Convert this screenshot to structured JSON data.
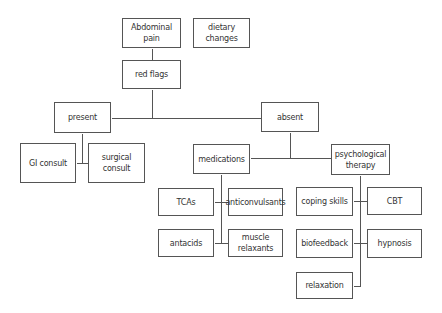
{
  "diagram": {
    "type": "flowchart",
    "background": "#ffffff",
    "line_color": "#555555",
    "nodes": [
      {
        "id": "abdominal-pain",
        "label": "Abdominal pain",
        "x": 122,
        "y": 18,
        "w": 59,
        "h": 30
      },
      {
        "id": "dietary-changes",
        "label": "dietary changes",
        "x": 193,
        "y": 18,
        "w": 57,
        "h": 30
      },
      {
        "id": "red-flags",
        "label": "red flags",
        "x": 122,
        "y": 60,
        "w": 59,
        "h": 29
      },
      {
        "id": "present",
        "label": "present",
        "x": 54,
        "y": 102,
        "w": 57,
        "h": 31
      },
      {
        "id": "absent",
        "label": "absent",
        "x": 261,
        "y": 102,
        "w": 58,
        "h": 30
      },
      {
        "id": "gi-consult",
        "label": "GI consult",
        "x": 20,
        "y": 143,
        "w": 56,
        "h": 40
      },
      {
        "id": "surgical-consult",
        "label": "surgical consult",
        "x": 88,
        "y": 143,
        "w": 57,
        "h": 40
      },
      {
        "id": "medications",
        "label": "medications",
        "x": 193,
        "y": 144,
        "w": 57,
        "h": 30
      },
      {
        "id": "psychological-therapy",
        "label": "psychological\ntherapy",
        "x": 331,
        "y": 144,
        "w": 59,
        "h": 31
      },
      {
        "id": "tcas",
        "label": "TCAs",
        "x": 158,
        "y": 188,
        "w": 56,
        "h": 28
      },
      {
        "id": "anticonvulsants",
        "label": "anticonvulsants",
        "x": 228,
        "y": 188,
        "w": 55,
        "h": 28
      },
      {
        "id": "antacids",
        "label": "antacids",
        "x": 158,
        "y": 229,
        "w": 56,
        "h": 28
      },
      {
        "id": "muscle-relaxants",
        "label": "muscle\nrelaxants",
        "x": 228,
        "y": 229,
        "w": 55,
        "h": 28
      },
      {
        "id": "coping-skills",
        "label": "coping skills",
        "x": 296,
        "y": 187,
        "w": 57,
        "h": 29
      },
      {
        "id": "cbt",
        "label": "CBT",
        "x": 367,
        "y": 187,
        "w": 55,
        "h": 28
      },
      {
        "id": "biofeedback",
        "label": "biofeedback",
        "x": 296,
        "y": 229,
        "w": 57,
        "h": 29
      },
      {
        "id": "hypnosis",
        "label": "hypnosis",
        "x": 367,
        "y": 229,
        "w": 55,
        "h": 29
      },
      {
        "id": "relaxation",
        "label": "relaxation",
        "x": 296,
        "y": 272,
        "w": 57,
        "h": 27
      }
    ],
    "edges": [
      {
        "from": "abdominal-pain",
        "to": "red-flags"
      },
      {
        "from": "red-flags",
        "to": "present"
      },
      {
        "from": "red-flags",
        "to": "absent"
      },
      {
        "from": "present",
        "to": "gi-consult"
      },
      {
        "from": "present",
        "to": "surgical-consult"
      },
      {
        "from": "absent",
        "to": "medications"
      },
      {
        "from": "absent",
        "to": "psychological-therapy"
      },
      {
        "from": "medications",
        "to": "tcas"
      },
      {
        "from": "medications",
        "to": "anticonvulsants"
      },
      {
        "from": "medications",
        "to": "antacids"
      },
      {
        "from": "medications",
        "to": "muscle-relaxants"
      },
      {
        "from": "psychological-therapy",
        "to": "coping-skills"
      },
      {
        "from": "psychological-therapy",
        "to": "cbt"
      },
      {
        "from": "psychological-therapy",
        "to": "biofeedback"
      },
      {
        "from": "psychological-therapy",
        "to": "hypnosis"
      },
      {
        "from": "psychological-therapy",
        "to": "relaxation"
      }
    ],
    "segments": [
      [
        152,
        48,
        152,
        60
      ],
      [
        152,
        89,
        152,
        118
      ],
      [
        111,
        118,
        261,
        118
      ],
      [
        82,
        133,
        82,
        163
      ],
      [
        76,
        163,
        88,
        163
      ],
      [
        290,
        132,
        290,
        158
      ],
      [
        250,
        158,
        331,
        158
      ],
      [
        221,
        174,
        221,
        243
      ],
      [
        214,
        202,
        228,
        202
      ],
      [
        214,
        243,
        228,
        243
      ],
      [
        360,
        175,
        360,
        286
      ],
      [
        353,
        201,
        367,
        201
      ],
      [
        353,
        243,
        367,
        243
      ],
      [
        353,
        286,
        360,
        286
      ]
    ]
  }
}
